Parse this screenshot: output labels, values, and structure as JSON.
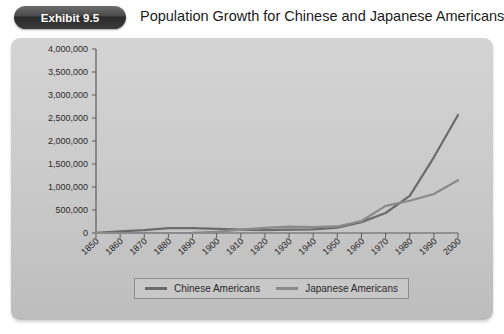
{
  "header": {
    "badge_label": "Exhibit 9.5",
    "title": "Population Growth for Chinese and Japanese Americans"
  },
  "legend": {
    "entries": [
      {
        "label": "Chinese Americans",
        "color": "#6b6b6b"
      },
      {
        "label": "Japanese Americans",
        "color": "#8a8a8a"
      }
    ]
  },
  "chart_data": {
    "type": "line",
    "title": "Population Growth for Chinese and Japanese Americans",
    "xlabel": "",
    "ylabel": "",
    "x": [
      1850,
      1860,
      1870,
      1880,
      1890,
      1900,
      1910,
      1920,
      1930,
      1940,
      1950,
      1960,
      1970,
      1980,
      1990,
      2000
    ],
    "categories": [
      "1850",
      "1860",
      "1870",
      "1880",
      "1890",
      "1900",
      "1910",
      "1920",
      "1930",
      "1940",
      "1950",
      "1960",
      "1970",
      "1980",
      "1990",
      "2000"
    ],
    "series": [
      {
        "name": "Chinese Americans",
        "color": "#6b6b6b",
        "values": [
          5000,
          35000,
          63000,
          105000,
          107000,
          90000,
          72000,
          62000,
          75000,
          78000,
          118000,
          237000,
          435000,
          806000,
          1645000,
          2565000
        ]
      },
      {
        "name": "Japanese Americans",
        "color": "#8a8a8a",
        "values": [
          0,
          0,
          55,
          148,
          2039,
          24000,
          72000,
          111000,
          139000,
          127000,
          142000,
          260000,
          591000,
          701000,
          848000,
          1148000
        ]
      }
    ],
    "ylim": [
      0,
      4000000
    ],
    "ytick_values": [
      0,
      500000,
      1000000,
      1500000,
      2000000,
      2500000,
      3000000,
      3500000,
      4000000
    ],
    "ytick_labels": [
      "0",
      "500,000",
      "1,000,000",
      "1,500,000",
      "2,000,000",
      "2,500,000",
      "3,000,000",
      "3,500,000",
      "4,000,000"
    ],
    "xlim": [
      1850,
      2000
    ],
    "grid": false,
    "legend_position": "bottom"
  }
}
